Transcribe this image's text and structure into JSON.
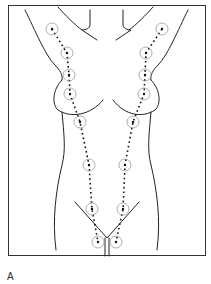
{
  "figure": {
    "panel_label": "A",
    "colors": {
      "outline": "#222222",
      "frame": "#333333",
      "circle": "#999999",
      "dots": "#111111"
    },
    "points_left": [
      [
        52,
        29
      ],
      [
        67,
        53
      ],
      [
        69,
        75
      ],
      [
        70,
        94
      ],
      [
        80,
        122
      ],
      [
        89,
        165
      ],
      [
        92,
        209
      ],
      [
        98,
        242
      ]
    ],
    "points_right": [
      [
        162,
        29
      ],
      [
        146,
        53
      ],
      [
        145,
        75
      ],
      [
        144,
        94
      ],
      [
        133,
        122
      ],
      [
        125,
        165
      ],
      [
        123,
        209
      ],
      [
        116,
        242
      ]
    ]
  }
}
